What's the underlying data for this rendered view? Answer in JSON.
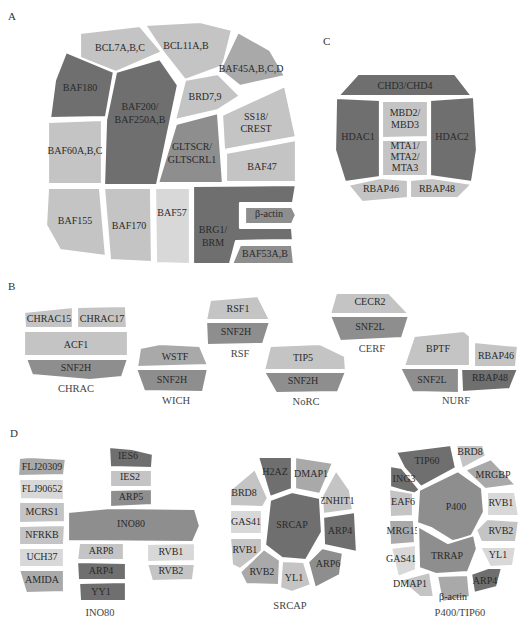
{
  "figure": {
    "panels": {
      "A": {
        "label": "A",
        "subunits": [
          {
            "name": "BCL7A,B,C",
            "shade": "light"
          },
          {
            "name": "BCL11A,B",
            "shade": "light"
          },
          {
            "name": "BAF45A,B,C,D",
            "shade": "medium-light"
          },
          {
            "name": "BAF180",
            "shade": "dark"
          },
          {
            "name": "BAF200/",
            "line2": "BAF250A,B",
            "shade": "dark"
          },
          {
            "name": "BRD7,9",
            "shade": "light"
          },
          {
            "name": "SS18/",
            "line2": "CREST",
            "shade": "light"
          },
          {
            "name": "BAF60A,B,C",
            "shade": "light"
          },
          {
            "name": "GLTSCR/",
            "line2": "GLTSCRL1",
            "shade": "medium"
          },
          {
            "name": "BAF47",
            "shade": "light"
          },
          {
            "name": "BAF155",
            "shade": "light"
          },
          {
            "name": "BAF170",
            "shade": "light"
          },
          {
            "name": "BAF57",
            "shade": "extra-light"
          },
          {
            "name": "BRG1/",
            "line2": "BRM",
            "shade": "dark"
          },
          {
            "name": "β-actin",
            "shade": "medium"
          },
          {
            "name": "BAF53A,B",
            "shade": "medium"
          }
        ]
      },
      "B": {
        "label": "B",
        "complexes": [
          {
            "caption": "CHRAC",
            "subunits": [
              "CHRAC15",
              "CHRAC17",
              "ACF1",
              "SNF2H"
            ]
          },
          {
            "caption": "WICH",
            "subunits": [
              "WSTF",
              "SNF2H"
            ]
          },
          {
            "caption": "RSF",
            "subunits": [
              "RSF1",
              "SNF2H"
            ]
          },
          {
            "caption": "NoRC",
            "subunits": [
              "TIP5",
              "SNF2H"
            ]
          },
          {
            "caption": "CERF",
            "subunits": [
              "CECR2",
              "SNF2L"
            ]
          },
          {
            "caption": "NURF",
            "subunits": [
              "BPTF",
              "RBAP46",
              "SNF2L",
              "RBAP48"
            ]
          }
        ]
      },
      "C": {
        "label": "C",
        "subunits": [
          {
            "name": "CHD3/CHD4",
            "shade": "dark"
          },
          {
            "name": "HDAC1",
            "shade": "dark"
          },
          {
            "name": "MBD2/",
            "line2": "MBD3",
            "shade": "light"
          },
          {
            "name": "MTA1/",
            "line2": "MTA2/",
            "line3": "MTA3",
            "shade": "light"
          },
          {
            "name": "HDAC2",
            "shade": "dark"
          },
          {
            "name": "RBAP46",
            "shade": "light"
          },
          {
            "name": "RBAP48",
            "shade": "light"
          }
        ]
      },
      "D": {
        "label": "D",
        "complexes": [
          {
            "caption": "INO80",
            "subunits": [
              "FLJ20309",
              "FLJ90652",
              "MCRS1",
              "NFRKB",
              "UCH37",
              "AMIDA",
              "IES6",
              "IES2",
              "ARP5",
              "INO80",
              "ARP8",
              "ARP4",
              "YY1",
              "RVB1",
              "RVB2"
            ]
          },
          {
            "caption": "SRCAP",
            "subunits": [
              "H2AZ",
              "DMAP1",
              "BRD8",
              "ZNHIT1",
              "GAS41",
              "SRCAP",
              "ARP4",
              "RVB1",
              "ARP6",
              "RVB2",
              "YL1"
            ]
          },
          {
            "caption": "P400/TIP60",
            "subunits": [
              "TIP60",
              "BRD8",
              "ING3",
              "MRGBP",
              "EAF6",
              "P400",
              "RVB1",
              "MRG15",
              "RVB2",
              "TRRAP",
              "GAS41",
              "YL1",
              "DMAP1",
              "β-actin",
              "ARP4"
            ]
          }
        ]
      }
    },
    "colors": {
      "dark": "#6f6f6f",
      "medium": "#8e8e8e",
      "medium-light": "#a9a9a9",
      "light": "#c4c4c4",
      "extra-light": "#d8d8d8",
      "border": "#ffffff"
    }
  }
}
